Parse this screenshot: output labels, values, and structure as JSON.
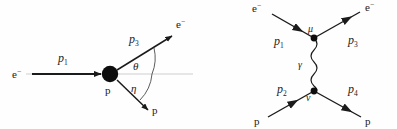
{
  "figure": {
    "background_color": "#fefefe",
    "line_color": "#1b1b1b",
    "reference_line_color": "#c9c9c9",
    "panel_count": 2
  },
  "left_panel": {
    "name": "kinematic-scattering-diagram",
    "incoming_electron_label": "e",
    "incoming_electron_charge": "−",
    "incoming_momentum_label": "p",
    "incoming_momentum_sub": "1",
    "target_label": "p",
    "outgoing_electron_label": "e",
    "outgoing_electron_charge": "−",
    "outgoing_momentum_label": "p",
    "outgoing_momentum_sub": "3",
    "outgoing_proton_label": "p",
    "angle_electron": "θ",
    "angle_proton": "η"
  },
  "right_panel": {
    "name": "feynman-diagram",
    "in_electron_label": "e",
    "in_electron_charge": "−",
    "out_electron_label": "e",
    "out_electron_charge": "−",
    "in_proton_label": "p",
    "out_proton_label": "p",
    "momentum_1": "p",
    "momentum_1_sub": "1",
    "momentum_2": "p",
    "momentum_2_sub": "2",
    "momentum_3": "p",
    "momentum_3_sub": "3",
    "momentum_4": "p",
    "momentum_4_sub": "4",
    "exchange_boson": "γ",
    "upper_vertex_index": "μ",
    "lower_vertex_index": "ν"
  }
}
